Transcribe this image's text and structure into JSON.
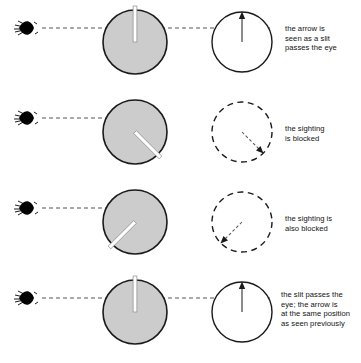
{
  "figure": {
    "width": 361,
    "height": 363,
    "background": "#ffffff",
    "colors": {
      "disk_fill": "#cccccc",
      "disk_stroke": "#1a1a1a",
      "slit_fill": "#ffffff",
      "circle_stroke": "#1a1a1a",
      "dashed_stroke": "#1a1a1a",
      "sight_line": "#555555",
      "eye_fill": "#000000",
      "text": "#111111"
    },
    "geometry": {
      "disk_center_x": 135,
      "disk_radius": 32,
      "view_center_x": 242,
      "view_radius": 30,
      "eye_x": 27,
      "text_x": 285,
      "row_centers_y": [
        42,
        132,
        222,
        312
      ],
      "sight_line_y_offset": -14
    }
  },
  "rows": [
    {
      "index": 1,
      "eye": {
        "name": "eye-icon",
        "label": "observer eye"
      },
      "sight_line": {
        "style": "dashed",
        "label": "line of sight"
      },
      "disk": {
        "fill": "#cccccc",
        "slit_angle_deg": 0,
        "slit_description": "slit at top, aligned with the line of sight"
      },
      "view": {
        "circle_style": "solid",
        "arrow_angle_deg": 0,
        "arrow_style": "solid",
        "arrow_description": "arrow points straight up"
      },
      "caption": "the arrow is\nseen as a slit\npasses the eye"
    },
    {
      "index": 2,
      "eye": {
        "name": "eye-icon",
        "label": "observer eye"
      },
      "sight_line": {
        "style": "dashed",
        "label": "line of sight"
      },
      "disk": {
        "fill": "#cccccc",
        "slit_angle_deg": 135,
        "slit_description": "slit rotated toward lower right"
      },
      "view": {
        "circle_style": "dashed",
        "arrow_angle_deg": 135,
        "arrow_style": "dashed",
        "arrow_description": "arrow points to lower right, not visible"
      },
      "caption": "the sighting\nis blocked"
    },
    {
      "index": 3,
      "eye": {
        "name": "eye-icon",
        "label": "observer eye"
      },
      "sight_line": {
        "style": "dashed",
        "label": "line of sight"
      },
      "disk": {
        "fill": "#cccccc",
        "slit_angle_deg": 225,
        "slit_description": "slit rotated toward lower left"
      },
      "view": {
        "circle_style": "dashed",
        "arrow_angle_deg": 225,
        "arrow_style": "dashed",
        "arrow_description": "arrow points to lower left, not visible"
      },
      "caption": "the sighting is\nalso blocked"
    },
    {
      "index": 4,
      "eye": {
        "name": "eye-icon",
        "label": "observer eye"
      },
      "sight_line": {
        "style": "dashed",
        "label": "line of sight"
      },
      "disk": {
        "fill": "#cccccc",
        "slit_angle_deg": 0,
        "slit_description": "slit back at top, aligned with the line of sight"
      },
      "view": {
        "circle_style": "solid",
        "arrow_angle_deg": 0,
        "arrow_style": "solid",
        "arrow_description": "arrow points straight up"
      },
      "caption": "the slit passes the\neye; the arrow is\nat the same position\nas seen previously"
    }
  ]
}
